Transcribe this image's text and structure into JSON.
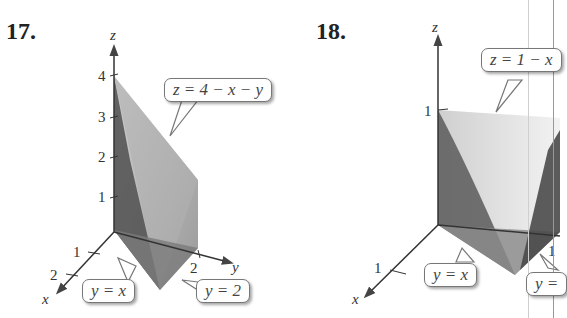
{
  "figures": [
    {
      "number": "17.",
      "axes": {
        "x": "x",
        "y": "y",
        "z": "z"
      },
      "z_ticks": [
        "1",
        "2",
        "3",
        "4"
      ],
      "x_ticks": [
        "1",
        "2"
      ],
      "y_ticks": [
        "2"
      ],
      "callouts": [
        "z = 4 − x − y",
        "y = x",
        "y = 2"
      ]
    },
    {
      "number": "18.",
      "axes": {
        "x": "x",
        "y": "y",
        "z": "z"
      },
      "z_ticks": [
        "1"
      ],
      "x_ticks": [
        "1"
      ],
      "y_ticks": [
        "1"
      ],
      "callouts": [
        "z = 1 − x",
        "y = x",
        "y ="
      ]
    }
  ],
  "colors": {
    "axis": "#333333",
    "surface_dark": "#4a4a4a",
    "surface_mid": "#8a8a8a",
    "surface_light": "#c8c8c8"
  }
}
